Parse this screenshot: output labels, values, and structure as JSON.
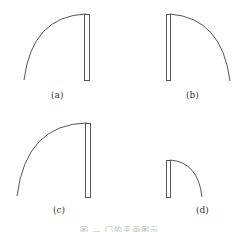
{
  "figure": {
    "stroke_color": "#555555",
    "panels": [
      {
        "id": "a",
        "label": "(a)",
        "swing": "left",
        "leaf": {
          "x": 84,
          "y": 14,
          "w": 5,
          "h": 66
        },
        "arc_end": [
          24,
          80
        ],
        "label_pos": [
          55,
          92
        ]
      },
      {
        "id": "b",
        "label": "(b)",
        "swing": "right",
        "leaf": {
          "x": 166,
          "y": 14,
          "w": 4,
          "h": 66
        },
        "arc_end": [
          230,
          81
        ],
        "label_pos": [
          190,
          92
        ]
      },
      {
        "id": "c",
        "label": "(c)",
        "swing": "left",
        "leaf": {
          "x": 85,
          "y": 123,
          "w": 5,
          "h": 74
        },
        "arc_end": [
          17,
          196
        ],
        "label_pos": [
          57,
          208
        ]
      },
      {
        "id": "d",
        "label": "(d)",
        "swing": "right",
        "leaf": {
          "x": 166,
          "y": 160,
          "w": 4,
          "h": 37
        },
        "arc_end": [
          202,
          197
        ],
        "label_pos": [
          200,
          208
        ]
      }
    ],
    "caption": "图 — 门的平面图示"
  }
}
